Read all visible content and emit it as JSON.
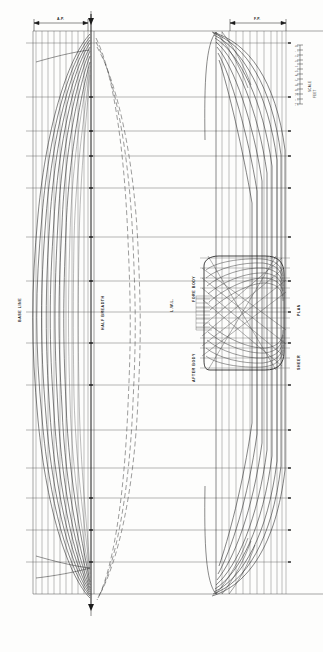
{
  "drawing": {
    "type": "ship-lines-plan",
    "orientation": "rotated-90-ccw",
    "width": 323,
    "height": 652,
    "paper_color": "#fdfdfc",
    "ink_color": "#1a1a1a",
    "light_ink_color": "#6f6f6f"
  },
  "labels": {
    "base_line": "BASE LINE",
    "half_breadth": "HALF BREADTH",
    "lwl": "L.W.L.",
    "fore_body": "FORE BODY",
    "after_body": "AFTER BODY",
    "sheer": "SHEER",
    "plan": "PLAN"
  },
  "dimensions": {
    "left_callout": "A.P.",
    "right_callout": "F.P.",
    "centerline_marker": "▼",
    "bottom_marker": "▼"
  },
  "scale_legend": {
    "title": "SCALE",
    "unit": "FEET",
    "ticks": [
      "0",
      "1",
      "2",
      "3",
      "4",
      "5",
      "6",
      "7",
      "8",
      "9",
      "10",
      "11",
      "12"
    ]
  },
  "station_numbers": [
    "0",
    "1",
    "2",
    "3",
    "4",
    "5",
    "6",
    "7",
    "8",
    "9",
    "10",
    "11",
    "12",
    "13",
    "14",
    "15",
    "16",
    "17",
    "18",
    "19",
    "20"
  ],
  "waterline_labels": [
    "W.L.1",
    "W.L.2",
    "W.L.3",
    "W.L.4",
    "W.L.5",
    "W.L.6",
    "W.L.7"
  ],
  "chart_data": {
    "type": "line",
    "subtitle": "Half Breadth · Body Plan · Sheer Plan",
    "xlabel": "Station",
    "ylabel": "Offset",
    "grid": true,
    "legend": "none",
    "xlim": [
      0,
      20
    ],
    "ylim": [
      0,
      7
    ],
    "notes": [
      "Half breadth plan occupies the left third of the sheet",
      "Body plan (sections) occupies the centre-right block",
      "Sheer / profile plan occupies the right third of the sheet"
    ],
    "series": [
      {
        "name": "W.L.1",
        "values": [
          0.0,
          0.9,
          2.1,
          3.3,
          4.3,
          5.1,
          5.7,
          6.1,
          6.3,
          6.4,
          6.4,
          6.4,
          6.3,
          6.1,
          5.8,
          5.3,
          4.6,
          3.7,
          2.6,
          1.3,
          0.0
        ]
      },
      {
        "name": "W.L.2",
        "values": [
          0.0,
          0.8,
          1.9,
          3.0,
          4.0,
          4.8,
          5.4,
          5.8,
          6.0,
          6.1,
          6.1,
          6.1,
          6.0,
          5.8,
          5.5,
          5.0,
          4.3,
          3.4,
          2.3,
          1.1,
          0.0
        ]
      },
      {
        "name": "W.L.3",
        "values": [
          0.0,
          0.7,
          1.7,
          2.7,
          3.6,
          4.4,
          5.0,
          5.4,
          5.6,
          5.7,
          5.7,
          5.7,
          5.6,
          5.4,
          5.0,
          4.5,
          3.8,
          2.9,
          1.9,
          0.8,
          0.0
        ]
      },
      {
        "name": "W.L.4",
        "values": [
          0.0,
          0.5,
          1.4,
          2.3,
          3.2,
          3.9,
          4.5,
          4.9,
          5.1,
          5.2,
          5.2,
          5.2,
          5.1,
          4.9,
          4.5,
          3.9,
          3.2,
          2.3,
          1.4,
          0.5,
          0.0
        ]
      },
      {
        "name": "W.L.5",
        "values": [
          0.0,
          0.4,
          1.1,
          1.9,
          2.7,
          3.4,
          3.9,
          4.3,
          4.5,
          4.6,
          4.6,
          4.6,
          4.5,
          4.2,
          3.8,
          3.2,
          2.5,
          1.7,
          0.9,
          0.3,
          0.0
        ]
      },
      {
        "name": "W.L.6",
        "values": [
          0.0,
          0.2,
          0.8,
          1.4,
          2.1,
          2.7,
          3.2,
          3.6,
          3.8,
          3.9,
          3.9,
          3.8,
          3.6,
          3.3,
          2.9,
          2.3,
          1.7,
          1.0,
          0.5,
          0.1,
          0.0
        ]
      },
      {
        "name": "W.L.7",
        "values": [
          0.0,
          0.1,
          0.5,
          1.0,
          1.5,
          2.0,
          2.5,
          2.8,
          3.0,
          3.1,
          3.0,
          2.9,
          2.7,
          2.3,
          1.9,
          1.4,
          0.9,
          0.5,
          0.2,
          0.0,
          0.0
        ]
      }
    ]
  }
}
